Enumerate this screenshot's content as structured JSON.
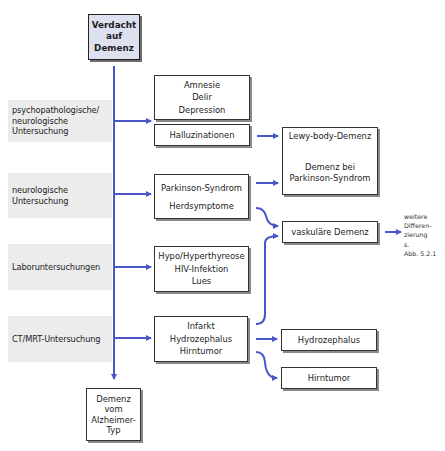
{
  "title": {
    "lines": [
      "Verdacht",
      "auf",
      "Demenz"
    ]
  },
  "bands": [
    {
      "lines": [
        "psychopathologische/",
        "neurologische",
        "Untersuchung"
      ]
    },
    {
      "lines": [
        "neurologische",
        "Untersuchung"
      ]
    },
    {
      "lines": [
        "Laboruntersuchungen"
      ]
    },
    {
      "lines": [
        "CT/MRT-Untersuchung"
      ]
    }
  ],
  "findings": {
    "psych": {
      "lines": [
        "Amnesie",
        "Delir",
        "Depression"
      ]
    },
    "hallucinations": {
      "lines": [
        "Halluzinationen"
      ]
    },
    "neuro": {
      "lines": [
        "Parkinson-Syndrom",
        "",
        "Herdsymptome"
      ]
    },
    "labor": {
      "lines": [
        "Hypo/Hyperthyreose",
        "HIV-Infektion",
        "Lues"
      ]
    },
    "imaging": {
      "lines": [
        "Infarkt",
        "Hydrozephalus",
        "Hirntumor"
      ]
    }
  },
  "diagnoses": {
    "lewy": {
      "lines": [
        "Lewy-body-Demenz",
        "",
        "",
        "Demenz bei",
        "Parkinson-Syndrom"
      ]
    },
    "vascular": {
      "lines": [
        "vaskuläre Demenz"
      ]
    },
    "hydrocephalus": {
      "lines": [
        "Hydrozephalus"
      ]
    },
    "tumor": {
      "lines": [
        "Hirntumor"
      ]
    },
    "alzheimer": {
      "lines": [
        "Demenz",
        "vom",
        "Alzheimer-",
        "Typ"
      ]
    }
  },
  "note": {
    "lines": [
      "weitere",
      "Differen-",
      "zierung",
      "s.",
      "Abb. 5.2.1"
    ]
  },
  "colors": {
    "arrow": "#4a55c8",
    "band": "#ececec",
    "title_fill": "#dde0ef"
  }
}
